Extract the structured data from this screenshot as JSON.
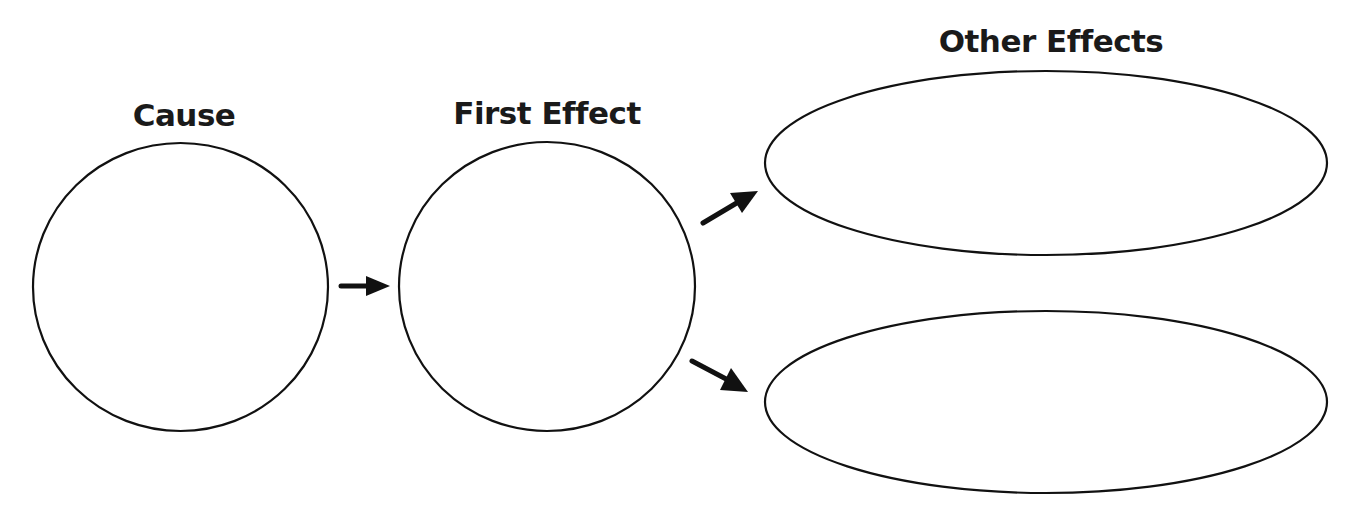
{
  "diagram": {
    "type": "cause-effect graphic organizer",
    "labels": {
      "cause": "Cause",
      "first_effect": "First Effect",
      "other_effects": "Other Effects"
    },
    "nodes": [
      {
        "id": "cause",
        "shape": "circle",
        "label": "Cause",
        "content": ""
      },
      {
        "id": "first-effect",
        "shape": "circle",
        "label": "First Effect",
        "content": ""
      },
      {
        "id": "other-effect-1",
        "shape": "ellipse",
        "label": "Other Effects",
        "content": ""
      },
      {
        "id": "other-effect-2",
        "shape": "ellipse",
        "label": "Other Effects",
        "content": ""
      }
    ],
    "edges": [
      {
        "from": "cause",
        "to": "first-effect",
        "style": "arrow"
      },
      {
        "from": "first-effect",
        "to": "other-effect-1",
        "style": "arrow"
      },
      {
        "from": "first-effect",
        "to": "other-effect-2",
        "style": "arrow"
      }
    ],
    "colors": {
      "stroke": "#111111",
      "text": "#1a1a1a",
      "background": "#ffffff"
    }
  }
}
